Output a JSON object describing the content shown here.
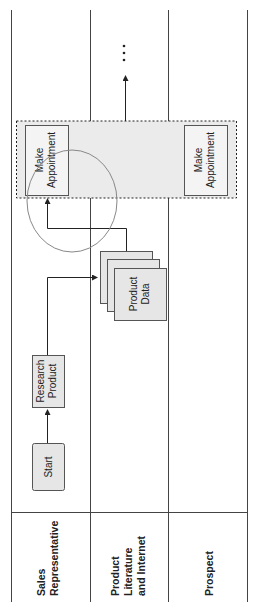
{
  "diagram": {
    "type": "swimlane",
    "orientation": "rotated-90-ccw",
    "lanes": [
      {
        "id": "sales",
        "label_lines": [
          "Sales",
          "Representative"
        ]
      },
      {
        "id": "literature",
        "label_lines": [
          "Product",
          "Literature",
          "and Internet"
        ]
      },
      {
        "id": "prospect",
        "label_lines": [
          "Prospect"
        ]
      }
    ],
    "nodes": {
      "start": {
        "label_lines": [
          "Start"
        ]
      },
      "research": {
        "label_lines": [
          "Research",
          "Product"
        ]
      },
      "product_data": {
        "label_lines": [
          "Product",
          "Data"
        ]
      },
      "appt_sales": {
        "label_lines": [
          "Make",
          "Appointment"
        ]
      },
      "appt_prospect": {
        "label_lines": [
          "Make",
          "Appointment"
        ]
      }
    },
    "continuation": "⋮",
    "colors": {
      "box_fill": "#e6e6e6",
      "group_fill": "#ebebeb",
      "line": "#333333",
      "ellipse": "#888888"
    }
  }
}
